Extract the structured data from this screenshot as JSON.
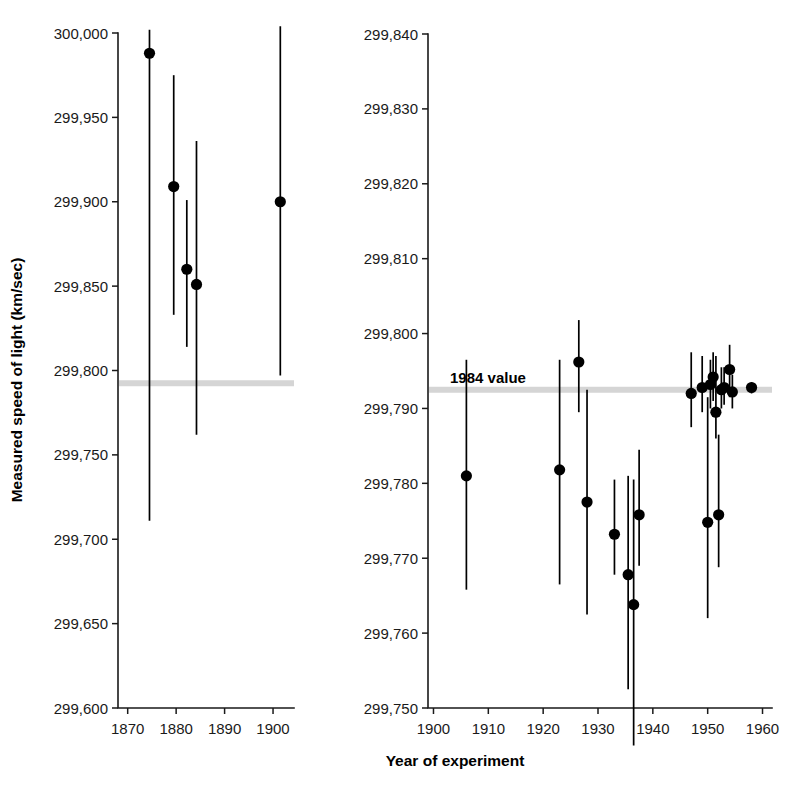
{
  "figure": {
    "xlabel": "Year of experiment",
    "ylabel": "Measured speed of light (km/sec)",
    "reference_label": "1984 value",
    "reference_color": "#d5d5d5",
    "marker_color": "#000000"
  },
  "chart_data": [
    {
      "type": "scatter",
      "panel": "left",
      "title": "",
      "xlabel": "Year of experiment",
      "ylabel": "Measured speed of light (km/sec)",
      "xlim": [
        1868,
        1904
      ],
      "ylim": [
        299600,
        300000
      ],
      "xticks": [
        1870,
        1880,
        1890,
        1900
      ],
      "xticklabels": [
        "1870",
        "1880",
        "1890",
        "1900"
      ],
      "yticks": [
        299600,
        299650,
        299700,
        299750,
        299800,
        299850,
        299900,
        299950,
        300000
      ],
      "yticklabels": [
        "299,600",
        "299,650",
        "299,700",
        "299,750",
        "299,800",
        "299,850",
        "299,900",
        "299,950",
        "300,000"
      ],
      "grid": false,
      "legend": false,
      "reference_line": {
        "label": "1984 value",
        "value": 299792.5,
        "color": "#d5d5d5"
      },
      "points": [
        {
          "x": 1874.5,
          "y": 299988,
          "ylow": 299711,
          "yhigh": 300002
        },
        {
          "x": 1879.5,
          "y": 299909,
          "ylow": 299833,
          "yhigh": 299975
        },
        {
          "x": 1882.2,
          "y": 299860,
          "ylow": 299814,
          "yhigh": 299901
        },
        {
          "x": 1884.2,
          "y": 299851,
          "ylow": 299762,
          "yhigh": 299936
        },
        {
          "x": 1901.5,
          "y": 299900,
          "ylow": 299797,
          "yhigh": 300004
        }
      ]
    },
    {
      "type": "scatter",
      "panel": "right",
      "title": "",
      "xlabel": "Year of experiment",
      "ylabel": "Measured speed of light (km/sec)",
      "xlim": [
        1899,
        1961
      ],
      "ylim": [
        299750,
        299840
      ],
      "xticks": [
        1900,
        1910,
        1920,
        1930,
        1940,
        1950,
        1960
      ],
      "xticklabels": [
        "1900",
        "1910",
        "1920",
        "1930",
        "1940",
        "1950",
        "1960"
      ],
      "yticks": [
        299750,
        299760,
        299770,
        299780,
        299790,
        299800,
        299810,
        299820,
        299830,
        299840
      ],
      "yticklabels": [
        "299,750",
        "299,760",
        "299,770",
        "299,780",
        "299,790",
        "299,800",
        "299,810",
        "299,820",
        "299,830",
        "299,840"
      ],
      "grid": false,
      "legend": false,
      "reference_line": {
        "label": "1984 value",
        "value": 299792.5,
        "color": "#d5d5d5"
      },
      "points": [
        {
          "x": 1906.0,
          "y": 299781.0,
          "ylow": 299765.8,
          "yhigh": 299796.5
        },
        {
          "x": 1923.0,
          "y": 299781.8,
          "ylow": 299766.5,
          "yhigh": 299796.5
        },
        {
          "x": 1926.5,
          "y": 299796.2,
          "ylow": 299789.5,
          "yhigh": 299801.8
        },
        {
          "x": 1928.0,
          "y": 299777.5,
          "ylow": 299762.5,
          "yhigh": 299792.5
        },
        {
          "x": 1933.0,
          "y": 299773.2,
          "ylow": 299767.8,
          "yhigh": 299780.5
        },
        {
          "x": 1935.5,
          "y": 299767.8,
          "ylow": 299752.5,
          "yhigh": 299781.0
        },
        {
          "x": 1936.5,
          "y": 299763.8,
          "ylow": 299745.0,
          "yhigh": 299780.5
        },
        {
          "x": 1937.5,
          "y": 299775.8,
          "ylow": 299769.0,
          "yhigh": 299784.5
        },
        {
          "x": 1947.0,
          "y": 299792.0,
          "ylow": 299787.5,
          "yhigh": 299797.5
        },
        {
          "x": 1949.0,
          "y": 299792.8,
          "ylow": 299789.5,
          "yhigh": 299797.0
        },
        {
          "x": 1950.0,
          "y": 299774.8,
          "ylow": 299762.0,
          "yhigh": 299791.5
        },
        {
          "x": 1950.5,
          "y": 299793.2,
          "ylow": 299790.0,
          "yhigh": 299796.5
        },
        {
          "x": 1951.0,
          "y": 299794.2,
          "ylow": 299791.0,
          "yhigh": 299797.5
        },
        {
          "x": 1951.5,
          "y": 299789.5,
          "ylow": 299786.0,
          "yhigh": 299797.0
        },
        {
          "x": 1952.0,
          "y": 299775.8,
          "ylow": 299768.8,
          "yhigh": 299786.5
        },
        {
          "x": 1952.5,
          "y": 299792.5,
          "ylow": 299790.0,
          "yhigh": 299795.5
        },
        {
          "x": 1953.0,
          "y": 299792.8,
          "ylow": 299790.5,
          "yhigh": 299795.5
        },
        {
          "x": 1954.0,
          "y": 299795.2,
          "ylow": 299791.5,
          "yhigh": 299798.5
        },
        {
          "x": 1954.5,
          "y": 299792.2,
          "ylow": 299790.0,
          "yhigh": 299794.5
        },
        {
          "x": 1958.0,
          "y": 299792.8,
          "ylow": 299792.0,
          "yhigh": 299793.5
        }
      ]
    }
  ]
}
